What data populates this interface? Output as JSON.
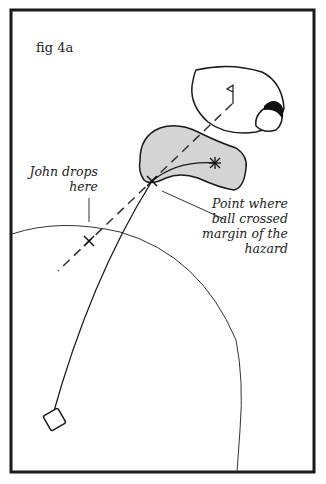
{
  "figure": {
    "title": "fig 4a",
    "labels": {
      "drop_point": [
        "John drops",
        "here"
      ],
      "crossing_point": [
        "Point where",
        "ball crossed",
        "margin of the",
        "hazard"
      ]
    },
    "elements": {
      "frame": "border",
      "green": "putting green with flag",
      "bunker": "greenside bunker",
      "hazard": "water hazard (grey)",
      "tee": "tee box",
      "ball_path": "curved ball flight line",
      "drop_line": "dashed line from flag through crossing point",
      "arc": "distance arc centered near tee",
      "drop_mark": "X mark",
      "crossing_mark": "X mark at hazard margin",
      "ball_rest": "asterisk in hazard"
    },
    "colors": {
      "ink": "#1a1a1a",
      "hazard_fill": "#d4d4d4",
      "background": "#ffffff"
    }
  }
}
